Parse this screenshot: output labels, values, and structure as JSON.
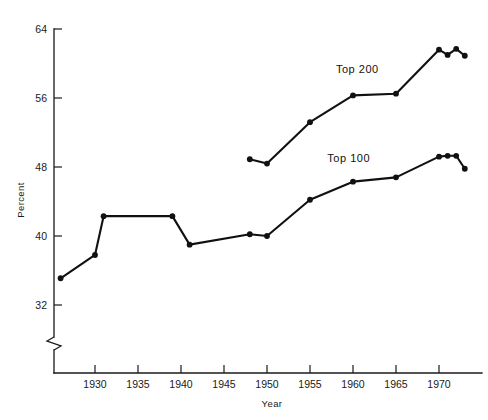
{
  "chart_data": {
    "type": "line",
    "title": "",
    "xlabel": "Year",
    "ylabel": "Percent",
    "xlim": [
      1925,
      1974
    ],
    "ylim": [
      32,
      64
    ],
    "xticks": [
      1930,
      1935,
      1940,
      1945,
      1950,
      1955,
      1960,
      1965,
      1970
    ],
    "xtick_labels": [
      "1930",
      "1935",
      "1940",
      "1945",
      "1950",
      "1955",
      "1960",
      "1965",
      "1970"
    ],
    "yticks": [
      32,
      40,
      48,
      56,
      64
    ],
    "ytick_labels": [
      "32",
      "40",
      "48",
      "56",
      "64"
    ],
    "grid": false,
    "legend_position": "inline-annotation",
    "y_axis_break": true,
    "y_axis_break_note": "zigzag break below 32",
    "series": [
      {
        "name": "Top 200",
        "label": "Top 200",
        "label_x": 1960.5,
        "label_y": 58.9,
        "color": "#111111",
        "x": [
          1948,
          1950,
          1955,
          1960,
          1965,
          1970,
          1971,
          1972,
          1973
        ],
        "values": [
          48.9,
          48.4,
          53.2,
          56.3,
          56.5,
          61.6,
          61.0,
          61.7,
          60.9
        ]
      },
      {
        "name": "Top 100",
        "label": "Top 100",
        "label_x": 1959.5,
        "label_y": 48.6,
        "color": "#111111",
        "x": [
          1926,
          1930,
          1931,
          1939,
          1941,
          1948,
          1950,
          1955,
          1960,
          1965,
          1970,
          1971,
          1972,
          1973
        ],
        "values": [
          35.1,
          37.8,
          42.3,
          42.3,
          39.0,
          40.2,
          40.0,
          44.2,
          46.3,
          46.8,
          49.2,
          49.3,
          49.3,
          47.8
        ]
      }
    ]
  }
}
